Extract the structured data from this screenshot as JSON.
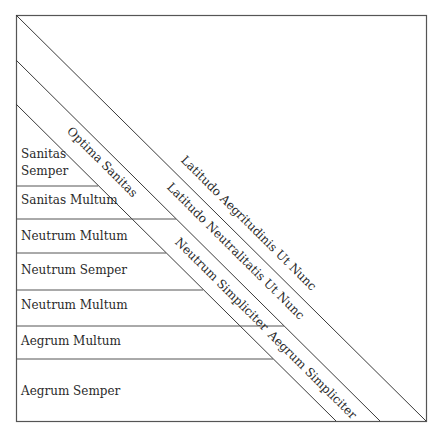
{
  "diagram": {
    "rows": [
      {
        "label_line1": "Sanitas",
        "label_line2": "Semper"
      },
      {
        "label": "Sanitas Multum"
      },
      {
        "label": "Neutrum Multum"
      },
      {
        "label": "Neutrum Semper"
      },
      {
        "label": "Neutrum Multum"
      },
      {
        "label": "Aegrum Multum"
      },
      {
        "label": "Aegrum Semper"
      }
    ],
    "diagonal_labels": {
      "optima_sanitas": "Optima Sanitas",
      "latitudo_aegritudinis": "Latitudo Aegritudinis Ut Nunc",
      "latitudo_neutralitatis": "Latitudo Neutralitatis Ut Nunc",
      "neutrum_simpliciter": "Neutrum Simpliciter",
      "aegrum_simpliciter": "Aegrum Simpliciter"
    },
    "colors": {
      "line": "#3a3a3a",
      "text": "#2a2a2a"
    }
  }
}
